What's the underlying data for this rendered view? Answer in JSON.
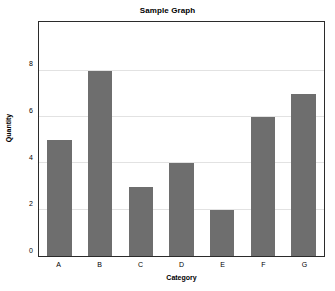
{
  "chart_data": {
    "type": "bar",
    "title": "Sample Graph",
    "xlabel": "Category",
    "ylabel": "Quantity",
    "categories": [
      "A",
      "B",
      "C",
      "D",
      "E",
      "F",
      "G"
    ],
    "values": [
      5,
      8,
      3,
      4,
      2,
      6,
      7
    ],
    "yticks": [
      0,
      2,
      4,
      6,
      8
    ],
    "ytick_labels": [
      "0",
      "2",
      "4",
      "6",
      "8"
    ],
    "ylim": [
      0,
      10.1
    ],
    "grid": "horizontal",
    "legend": "none",
    "colors": {
      "bar": "#6e6e6e",
      "background": "#ffffff",
      "gridline": "#e2e2e2",
      "axis_border": "#2b2b2b",
      "text": "#000000"
    }
  }
}
